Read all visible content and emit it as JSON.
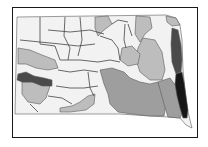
{
  "map": {
    "subject": "South Dakota choropleth map of watershed regions",
    "legend": [],
    "colors": {
      "class_1": "#f2f2f2",
      "class_2": "#bdbdbd",
      "class_3": "#9e9e9e",
      "class_4": "#4a4a4a",
      "class_5": "#161616",
      "border": "#1a1a1a"
    },
    "regions": [
      {
        "name": "base-state",
        "class": "class_1",
        "d": "M17 17 L166 15 L176 18 L180 25 L182 40 L183 70 L185 90 L187 108 L192 128 L186 125 L180 118 L168 117 L150 116 L120 114 L80 114 L40 114 L15 114 Z"
      },
      {
        "name": "northwest-grey-patch",
        "class": "class_2",
        "d": "M95 17 L108 16 L112 24 L104 30 L98 36 L95 28 Z"
      },
      {
        "name": "north-central-grey",
        "class": "class_2",
        "d": "M136 16 L150 17 L152 28 L145 34 L140 42 L135 34 Z"
      },
      {
        "name": "northeast-light-grey",
        "class": "class_2",
        "d": "M166 16 L176 18 L180 25 L172 26 L167 22 Z"
      },
      {
        "name": "west-grey-basin",
        "class": "class_2",
        "d": "M18 48 L30 50 L42 55 L55 60 L58 68 L48 70 L36 68 L26 64 L18 64 Z"
      },
      {
        "name": "southwest-grey-basin",
        "class": "class_2",
        "d": "M22 82 L38 82 L50 86 L46 98 L40 104 L28 102 L22 94 Z"
      },
      {
        "name": "east-central-grey",
        "class": "class_2",
        "d": "M143 38 L155 40 L162 52 L165 70 L162 80 L150 80 L140 72 L136 60 L138 48 Z"
      },
      {
        "name": "central-grey-patch",
        "class": "class_2",
        "d": "M122 48 L132 46 L140 54 L138 64 L128 66 L120 60 Z"
      },
      {
        "name": "south-grey-streak",
        "class": "class_2",
        "d": "M60 108 L72 106 L80 102 L88 96 L95 94 L94 104 L86 110 L70 112 L60 112 Z"
      },
      {
        "name": "southeast-mid-grey-a",
        "class": "class_3",
        "d": "M100 70 L112 68 L124 72 L130 78 L140 82 L150 84 L158 82 L164 90 L166 104 L164 116 L150 116 L132 114 L118 112 L110 104 L108 94 L104 84 Z"
      },
      {
        "name": "southeast-mid-grey-b",
        "class": "class_3",
        "d": "M158 82 L170 78 L176 86 L180 100 L182 114 L180 118 L168 117 L164 104 Z"
      },
      {
        "name": "northeast-dark-strip",
        "class": "class_4",
        "d": "M172 28 L178 30 L181 45 L182 60 L181 72 L176 74 L172 62 L171 44 Z"
      },
      {
        "name": "west-dark-streak",
        "class": "class_4",
        "d": "M18 74 L26 72 L34 76 L44 78 L52 80 L52 86 L42 86 L32 82 L22 82 L17 80 Z"
      },
      {
        "name": "southeast-black-region",
        "class": "class_5",
        "d": "M176 74 L182 72 L184 82 L186 96 L188 110 L187 118 L183 118 L180 108 L177 96 L175 84 Z"
      }
    ],
    "boundaries": [
      "M40 17 L40 44 L55 46 L60 60",
      "M65 17 L64 36 L70 48 L68 60",
      "M80 17 L82 40 L78 56",
      "M48 30 L70 32 L90 30 L104 34",
      "M20 40 L40 42 L60 44 L78 46 L95 44",
      "M60 60 L80 60 L98 62 L110 60 L120 62",
      "M100 36 L112 40 L118 48 L120 60",
      "M125 24 L124 40 L126 48",
      "M128 24 L132 36",
      "M58 70 L70 72 L84 70 L98 72",
      "M56 86 L70 88 L84 88 L98 86",
      "M48 96 L62 98 L72 104",
      "M88 72 L90 88 L94 96",
      "M30 104 L38 112",
      "M112 24 L118 20 L128 22"
    ]
  }
}
